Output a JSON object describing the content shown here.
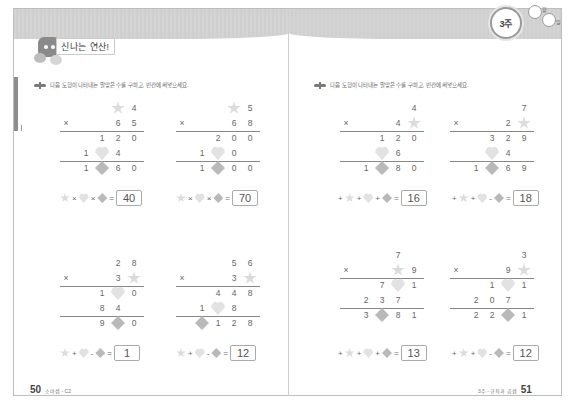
{
  "header": {
    "section_title": "신나는 연산!",
    "week_badge": "3주",
    "month_label": "월",
    "day_label": "일"
  },
  "instruction": "다음 도형이 나타내는 알맞은 수를 구하고, 빈칸에 써넣으세요.",
  "footer": {
    "left_page_number": "50",
    "left_label": "소마셈 - C2",
    "right_label": "3주 - 규칙과 곱셈",
    "right_page_number": "51"
  },
  "problems": [
    {
      "rows": [
        [
          "",
          "",
          "star",
          "4"
        ],
        [
          "×",
          "",
          "6",
          "5"
        ],
        [
          "",
          "1",
          "2",
          "0"
        ],
        [
          "",
          "1",
          "heart",
          "4"
        ],
        [
          "",
          "1",
          "diamond",
          "6",
          "0"
        ]
      ],
      "top": [
        "",
        "",
        "star",
        "4"
      ],
      "mult": [
        "×",
        "",
        "6",
        "5"
      ],
      "p1": [
        "",
        "1",
        "2",
        "0"
      ],
      "p2": [
        "1",
        "heart",
        "4",
        ""
      ],
      "res": [
        "1",
        "diamond",
        "6",
        "0"
      ],
      "expr": [
        "star",
        "×",
        "heart",
        "×",
        "diamond",
        "="
      ],
      "answer": "40"
    },
    {
      "top": [
        "",
        "",
        "star",
        "5"
      ],
      "mult": [
        "×",
        "",
        "6",
        "8"
      ],
      "p1": [
        "",
        "2",
        "0",
        "0"
      ],
      "p2": [
        "1",
        "heart",
        "0",
        ""
      ],
      "res": [
        "1",
        "diamond",
        "0",
        "0"
      ],
      "expr": [
        "star",
        "×",
        "heart",
        "×",
        "diamond",
        "="
      ],
      "answer": "70"
    },
    {
      "top": [
        "",
        "",
        "2",
        "8"
      ],
      "mult": [
        "×",
        "",
        "3",
        "star"
      ],
      "p1": [
        "",
        "1",
        "heart",
        "0"
      ],
      "p2": [
        "",
        "8",
        "4",
        ""
      ],
      "res": [
        "",
        "9",
        "diamond",
        "0"
      ],
      "expr": [
        "star",
        "+",
        "heart",
        "-",
        "diamond",
        "="
      ],
      "answer": "1"
    },
    {
      "top": [
        "",
        "",
        "5",
        "6"
      ],
      "mult": [
        "×",
        "",
        "3",
        "star"
      ],
      "p1": [
        "",
        "4",
        "4",
        "8"
      ],
      "p2": [
        "1",
        "heart",
        "8",
        ""
      ],
      "res": [
        "diamond",
        "1",
        "2",
        "8"
      ],
      "expr": [
        "star",
        "+",
        "heart",
        "-",
        "diamond",
        "="
      ],
      "answer": "12"
    },
    {
      "top": [
        "",
        "",
        "",
        "4"
      ],
      "mult": [
        "×",
        "",
        "4",
        "star"
      ],
      "p1": [
        "",
        "1",
        "2",
        "0"
      ],
      "p2": [
        "",
        "heart",
        "6",
        ""
      ],
      "res": [
        "1",
        "diamond",
        "8",
        "0"
      ],
      "expr": [
        "+",
        "star",
        "+",
        "heart",
        "+",
        "diamond",
        "="
      ],
      "answer": "16"
    },
    {
      "top": [
        "",
        "",
        "",
        "7"
      ],
      "mult": [
        "×",
        "",
        "2",
        "star"
      ],
      "p1": [
        "",
        "3",
        "2",
        "9"
      ],
      "p2": [
        "",
        "heart",
        "4",
        ""
      ],
      "res": [
        "1",
        "diamond",
        "6",
        "9"
      ],
      "expr": [
        "+",
        "star",
        "+",
        "heart",
        "-",
        "diamond",
        "="
      ],
      "answer": "18"
    },
    {
      "top": [
        "",
        "",
        "7",
        ""
      ],
      "mult": [
        "×",
        "",
        "star",
        "9"
      ],
      "p1": [
        "",
        "7",
        "heart",
        "1"
      ],
      "p2": [
        "2",
        "3",
        "7",
        ""
      ],
      "res": [
        "3",
        "diamond",
        "8",
        "1"
      ],
      "expr": [
        "+",
        "star",
        "+",
        "heart",
        "+",
        "diamond",
        "="
      ],
      "answer": "13"
    },
    {
      "top": [
        "",
        "",
        "",
        "3"
      ],
      "mult": [
        "×",
        "",
        "9",
        "star"
      ],
      "p1": [
        "",
        "1",
        "heart",
        "1"
      ],
      "p2": [
        "2",
        "0",
        "7",
        ""
      ],
      "res": [
        "2",
        "2",
        "diamond",
        "1"
      ],
      "expr": [
        "+",
        "star",
        "+",
        "heart",
        "-",
        "diamond",
        "="
      ],
      "answer": "12"
    }
  ],
  "colors": {
    "star": "#dcdcdc",
    "heart": "#e2e2e2",
    "diamond": "#b9b9b9",
    "band": "#d2d2d2",
    "text": "#555555"
  }
}
